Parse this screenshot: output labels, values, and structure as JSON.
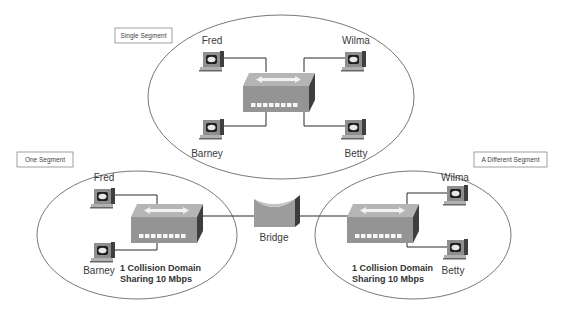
{
  "segments": {
    "top": {
      "label": "Single Segment",
      "hosts": {
        "top_left": "Fred",
        "top_right": "Wilma",
        "bottom_left": "Barney",
        "bottom_right": "Betty"
      }
    },
    "left": {
      "label": "One Segment",
      "hosts": {
        "top": "Fred",
        "bottom": "Barney"
      },
      "note_line1": "1 Collision Domain",
      "note_line2": "Sharing 10 Mbps"
    },
    "right": {
      "label": "A Different Segment",
      "hosts": {
        "top": "Wilma",
        "bottom": "Betty"
      },
      "note_line1": "1 Collision Domain",
      "note_line2": "Sharing 10 Mbps"
    }
  },
  "bridge": {
    "label": "Bridge"
  },
  "icons": {
    "pc": "workstation-icon",
    "hub": "hub-icon",
    "bridge": "bridge-icon"
  },
  "colors": {
    "device_face": "#9a9a9a",
    "device_top": "#b8b8b8",
    "device_side": "#4a4a4a",
    "line": "#2b2b2b",
    "ellipse": "#555555"
  }
}
